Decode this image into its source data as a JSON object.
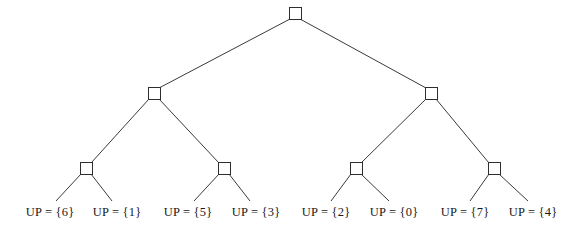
{
  "diagram": {
    "type": "binary-tree",
    "title": "",
    "background_color": "#ffffff",
    "node_stroke_color": "#2e2e2e",
    "node_fill_color": "#ffffff",
    "edge_color": "#3a3a3a",
    "text_color": "#1a1a1a",
    "node_shape": "square",
    "node_size": 12,
    "levels": 4,
    "internal_node_count": 7,
    "leaf_count": 8
  },
  "nodes": [
    {
      "id": "root",
      "label": "",
      "level": 0,
      "x": 295,
      "y": 13
    },
    {
      "id": "n-l",
      "label": "",
      "level": 1,
      "x": 154,
      "y": 93
    },
    {
      "id": "n-r",
      "label": "",
      "level": 1,
      "x": 431,
      "y": 93
    },
    {
      "id": "n-ll",
      "label": "",
      "level": 2,
      "x": 86,
      "y": 168
    },
    {
      "id": "n-lr",
      "label": "",
      "level": 2,
      "x": 224,
      "y": 168
    },
    {
      "id": "n-rl",
      "label": "",
      "level": 2,
      "x": 356,
      "y": 168
    },
    {
      "id": "n-rr",
      "label": "",
      "level": 2,
      "x": 494,
      "y": 168
    }
  ],
  "edges": [
    {
      "from": "root",
      "to": "n-l",
      "x1": 290,
      "y1": 19,
      "x2": 159,
      "y2": 88
    },
    {
      "from": "root",
      "to": "n-r",
      "x1": 300,
      "y1": 19,
      "x2": 426,
      "y2": 88
    },
    {
      "from": "n-l",
      "to": "n-ll",
      "x1": 149,
      "y1": 99,
      "x2": 91,
      "y2": 163
    },
    {
      "from": "n-l",
      "to": "n-lr",
      "x1": 159,
      "y1": 99,
      "x2": 219,
      "y2": 163
    },
    {
      "from": "n-r",
      "to": "n-rl",
      "x1": 426,
      "y1": 99,
      "x2": 361,
      "y2": 163
    },
    {
      "from": "n-r",
      "to": "n-rr",
      "x1": 436,
      "y1": 99,
      "x2": 489,
      "y2": 163
    },
    {
      "from": "n-ll",
      "to": "leaf-0",
      "x1": 81,
      "y1": 174,
      "x2": 56,
      "y2": 201
    },
    {
      "from": "n-ll",
      "to": "leaf-1",
      "x1": 91,
      "y1": 174,
      "x2": 112,
      "y2": 201
    },
    {
      "from": "n-lr",
      "to": "leaf-2",
      "x1": 219,
      "y1": 174,
      "x2": 194,
      "y2": 201
    },
    {
      "from": "n-lr",
      "to": "leaf-3",
      "x1": 229,
      "y1": 174,
      "x2": 250,
      "y2": 201
    },
    {
      "from": "n-rl",
      "to": "leaf-4",
      "x1": 351,
      "y1": 174,
      "x2": 331,
      "y2": 201
    },
    {
      "from": "n-rl",
      "to": "leaf-5",
      "x1": 361,
      "y1": 174,
      "x2": 389,
      "y2": 201
    },
    {
      "from": "n-rr",
      "to": "leaf-6",
      "x1": 489,
      "y1": 174,
      "x2": 470,
      "y2": 201
    },
    {
      "from": "n-rr",
      "to": "leaf-7",
      "x1": 499,
      "y1": 174,
      "x2": 528,
      "y2": 201
    }
  ],
  "leaves": [
    {
      "id": "leaf-0",
      "label": "UP = {6}",
      "value": "6",
      "x": 50,
      "y": 205
    },
    {
      "id": "leaf-1",
      "label": "UP = {1}",
      "value": "1",
      "x": 117,
      "y": 205
    },
    {
      "id": "leaf-2",
      "label": "UP = {5}",
      "value": "5",
      "x": 188,
      "y": 205
    },
    {
      "id": "leaf-3",
      "label": "UP = {3}",
      "value": "3",
      "x": 256,
      "y": 205
    },
    {
      "id": "leaf-4",
      "label": "UP = {2}",
      "value": "2",
      "x": 326,
      "y": 205
    },
    {
      "id": "leaf-5",
      "label": "UP = {0}",
      "value": "0",
      "x": 394,
      "y": 205
    },
    {
      "id": "leaf-6",
      "label": "UP = {7}",
      "value": "7",
      "x": 465,
      "y": 205
    },
    {
      "id": "leaf-7",
      "label": "UP = {4}",
      "value": "4",
      "x": 533,
      "y": 205
    }
  ]
}
